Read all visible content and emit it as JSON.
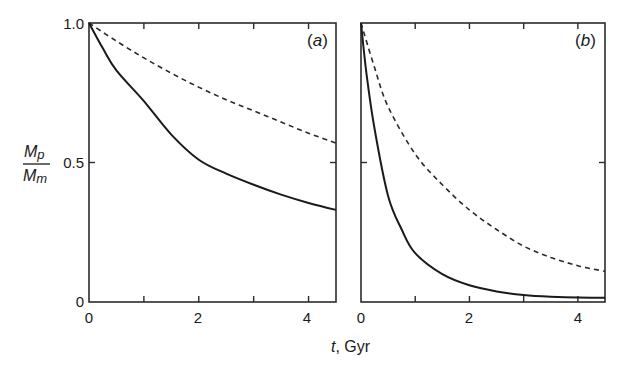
{
  "chart_data": [
    {
      "type": "line",
      "panel_label": "(a)",
      "panel_letter": "a",
      "xlabel": "t, Gyr",
      "ylabel": "Mp/Mm",
      "xlim": [
        0,
        4.5
      ],
      "ylim": [
        0,
        1.0
      ],
      "xticks": [
        0,
        1,
        2,
        3,
        4
      ],
      "xtick_labels": [
        "0",
        "2",
        "4"
      ],
      "yticks": [
        0,
        0.5,
        1.0
      ],
      "ytick_labels": [
        "0",
        "0.5",
        "1.0"
      ],
      "grid": false,
      "legend": null,
      "series": [
        {
          "name": "solid",
          "style": "solid",
          "x": [
            0,
            0.25,
            0.5,
            1,
            1.5,
            2,
            2.5,
            3,
            3.5,
            4,
            4.5
          ],
          "y": [
            1.0,
            0.91,
            0.83,
            0.72,
            0.6,
            0.51,
            0.46,
            0.42,
            0.385,
            0.355,
            0.33
          ]
        },
        {
          "name": "dashed",
          "style": "dashed",
          "x": [
            0,
            0.5,
            1,
            1.5,
            2,
            2.5,
            3,
            3.5,
            4,
            4.5
          ],
          "y": [
            1.0,
            0.935,
            0.875,
            0.82,
            0.77,
            0.725,
            0.685,
            0.645,
            0.605,
            0.57
          ]
        }
      ]
    },
    {
      "type": "line",
      "panel_label": "(b)",
      "panel_letter": "b",
      "xlabel": "t, Gyr",
      "ylabel": "Mp/Mm",
      "xlim": [
        0,
        4.5
      ],
      "ylim": [
        0,
        1.0
      ],
      "xticks": [
        0,
        1,
        2,
        3,
        4
      ],
      "xtick_labels": [
        "0",
        "2",
        "4"
      ],
      "yticks": [
        0,
        0.5,
        1.0
      ],
      "ytick_labels": [],
      "grid": false,
      "legend": null,
      "series": [
        {
          "name": "solid",
          "style": "solid",
          "x": [
            0,
            0.1,
            0.25,
            0.5,
            0.75,
            1,
            1.5,
            2,
            2.5,
            3,
            3.5,
            4,
            4.5
          ],
          "y": [
            1.0,
            0.82,
            0.62,
            0.38,
            0.26,
            0.175,
            0.1,
            0.06,
            0.038,
            0.025,
            0.019,
            0.016,
            0.015
          ]
        },
        {
          "name": "dashed",
          "style": "dashed",
          "x": [
            0,
            0.25,
            0.5,
            1,
            1.5,
            2,
            2.5,
            3,
            3.5,
            4,
            4.5
          ],
          "y": [
            1.0,
            0.84,
            0.7,
            0.53,
            0.42,
            0.33,
            0.26,
            0.2,
            0.16,
            0.13,
            0.11
          ]
        }
      ]
    }
  ],
  "labels": {
    "y_axis_numerator": "M",
    "y_axis_numerator_sub": "p",
    "y_axis_denominator": "M",
    "y_axis_denominator_sub": "m",
    "x_axis_var": "t",
    "x_axis_unit": ", Gyr",
    "ytick_1": "1.0",
    "ytick_05": "0.5",
    "ytick_0": "0",
    "xtick_a_0": "0",
    "xtick_a_2": "2",
    "xtick_a_4": "4",
    "xtick_b_0": "0",
    "xtick_b_2": "2",
    "xtick_b_4": "4",
    "panel_a_open": "(",
    "panel_a_letter": "a",
    "panel_a_close": ")",
    "panel_b_open": "(",
    "panel_b_letter": "b",
    "panel_b_close": ")"
  }
}
